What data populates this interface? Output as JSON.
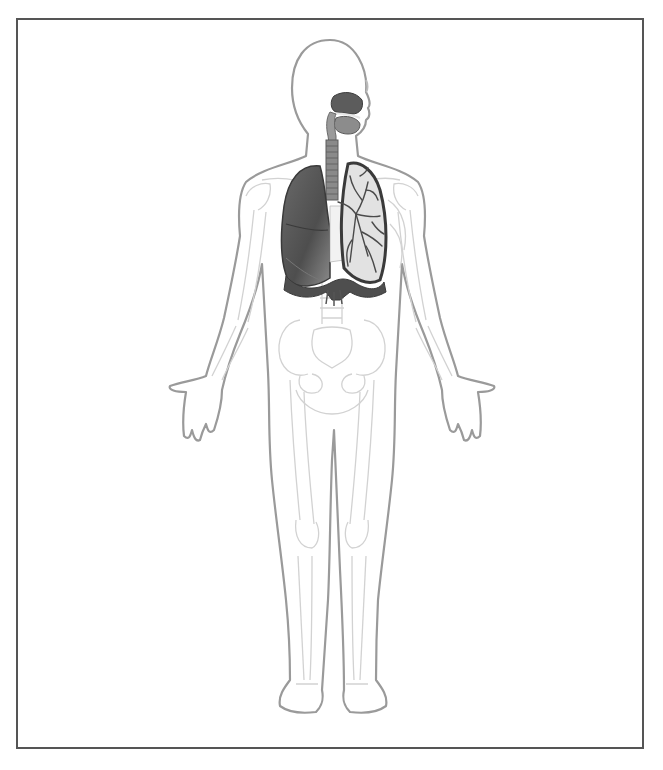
{
  "figure": {
    "style": "grayscale anatomical illustration",
    "labels": [],
    "colors": {
      "background": "#ffffff",
      "frame": "#555555",
      "body_outline": "#9a9a9a",
      "skeleton_line": "#cfcfcf",
      "lung_dark": "#555555",
      "lung_light": "#d9d9d9",
      "airway": "#8a8a8a"
    },
    "structures": [
      {
        "id": "nasal-cavity",
        "name": "Nasal cavity"
      },
      {
        "id": "oral-cavity",
        "name": "Oral cavity"
      },
      {
        "id": "pharynx",
        "name": "Pharynx"
      },
      {
        "id": "larynx",
        "name": "Larynx"
      },
      {
        "id": "trachea",
        "name": "Trachea"
      },
      {
        "id": "right-lung",
        "name": "Right lung"
      },
      {
        "id": "left-lung",
        "name": "Left lung (bronchial tree visible)"
      },
      {
        "id": "diaphragm",
        "name": "Diaphragm"
      }
    ]
  }
}
